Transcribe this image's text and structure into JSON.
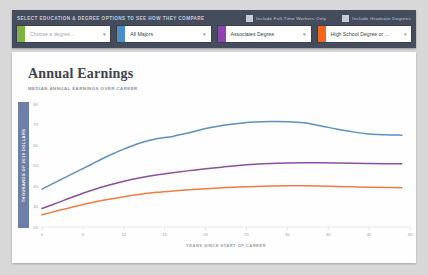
{
  "controls": {
    "heading": "SELECT EDUCATION & DEGREE OPTIONS TO SEE HOW THEY COMPARE",
    "checkboxes": [
      {
        "label": "Include Full-Time Workers Only",
        "checked": true
      },
      {
        "label": "Include Graduate Degrees",
        "checked": true
      }
    ],
    "selects": [
      {
        "value": "Choose a degree...",
        "placeholder": true,
        "color": "#7cb342"
      },
      {
        "value": "All Majors",
        "placeholder": false,
        "color": "#4a90c4"
      },
      {
        "value": "Associates Degree",
        "placeholder": false,
        "color": "#8e44ad"
      },
      {
        "value": "High School Degree or ...",
        "placeholder": false,
        "color": "#f4661b"
      }
    ],
    "caret": "▾"
  },
  "chart_header": {
    "title": "Annual Earnings",
    "subtitle": "MEDIAN ANNUAL EARNINGS OVER CAREER"
  },
  "chart_data": {
    "type": "line",
    "title": "Annual Earnings",
    "subtitle": "MEDIAN ANNUAL EARNINGS OVER CAREER",
    "xlabel": "YEARS SINCE START OF CAREER",
    "ylabel": "THOUSANDS OF 2019 DOLLARS",
    "xlim": [
      0,
      45
    ],
    "ylim": [
      20,
      80
    ],
    "xticks": [
      0,
      5,
      10,
      15,
      20,
      25,
      30,
      35,
      40,
      45
    ],
    "yticks": [
      20,
      30,
      40,
      50,
      60,
      70,
      80
    ],
    "grid": false,
    "legend": "none",
    "x": [
      0,
      2,
      4,
      6,
      8,
      10,
      12,
      14,
      16,
      18,
      20,
      22,
      24,
      26,
      28,
      30,
      32,
      34,
      36,
      38,
      40,
      42,
      44
    ],
    "series": [
      {
        "name": "All Majors",
        "color": "#5b90bf",
        "values": [
          38.5,
          42.5,
          46.5,
          50.5,
          54.5,
          58.0,
          61.0,
          63.0,
          64.2,
          66.0,
          68.0,
          69.5,
          70.5,
          71.2,
          71.5,
          71.4,
          70.8,
          69.4,
          67.8,
          66.4,
          65.4,
          65.0,
          64.8
        ]
      },
      {
        "name": "Associates Degree",
        "color": "#8a4f9e",
        "values": [
          29.0,
          32.0,
          35.0,
          37.8,
          40.2,
          42.3,
          44.0,
          45.4,
          46.5,
          47.5,
          48.4,
          49.2,
          50.0,
          50.6,
          51.0,
          51.2,
          51.3,
          51.3,
          51.2,
          51.1,
          51.0,
          50.9,
          50.9
        ]
      },
      {
        "name": "High School Degree or ...",
        "color": "#ef7b45",
        "values": [
          26.0,
          28.0,
          30.0,
          31.8,
          33.4,
          34.8,
          36.0,
          36.9,
          37.6,
          38.2,
          38.7,
          39.1,
          39.5,
          39.8,
          40.0,
          40.1,
          40.1,
          40.0,
          39.8,
          39.6,
          39.4,
          39.3,
          39.2
        ]
      }
    ]
  }
}
